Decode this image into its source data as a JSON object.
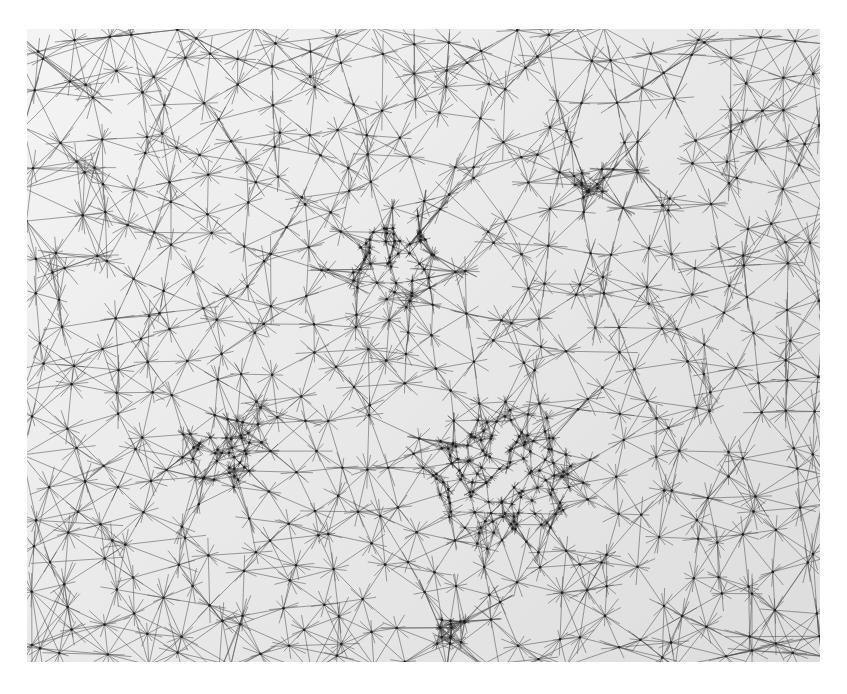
{
  "canvas": {
    "width": 847,
    "height": 694,
    "background": "#ffffff"
  },
  "artwork": {
    "kind": "network-drawing",
    "x": 27,
    "y": 29,
    "width": 793,
    "height": 633,
    "paper_color_light": "#f4f4f4",
    "paper_color_dark": "#dddddd",
    "line_color": "#4a4a4a",
    "line_width": 0.7,
    "line_opacity": 0.75,
    "node_color": "#1e1e1e",
    "node_radius": 1.3,
    "seed": 20240611,
    "grid_spacing": 34,
    "grid_jitter": 0.45,
    "neighbors_per_node": 7,
    "line_overshoot": 0.35,
    "clusters": [
      {
        "cx": 475,
        "cy": 450,
        "r": 70,
        "count": 110,
        "label": "dense-center-bottom"
      },
      {
        "cx": 370,
        "cy": 240,
        "r": 45,
        "count": 45,
        "label": "dense-upper-center"
      },
      {
        "cx": 200,
        "cy": 420,
        "r": 40,
        "count": 35,
        "label": "dense-left"
      },
      {
        "cx": 565,
        "cy": 155,
        "r": 18,
        "count": 12,
        "label": "hub-upper-right"
      },
      {
        "cx": 420,
        "cy": 600,
        "r": 20,
        "count": 14,
        "label": "hub-bottom"
      }
    ]
  }
}
